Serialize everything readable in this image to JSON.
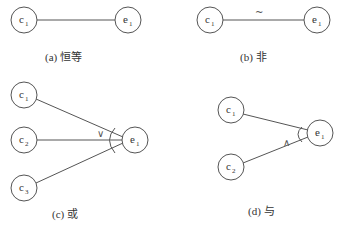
{
  "panels": [
    {
      "id": "a",
      "caption": "(a) 恒等",
      "relation": "identity",
      "symbol": "",
      "causes": [
        {
          "base": "c",
          "sub": "1"
        }
      ],
      "effect": {
        "base": "e",
        "sub": "1"
      }
    },
    {
      "id": "b",
      "caption": "(b) 非",
      "relation": "not",
      "symbol": "~",
      "causes": [
        {
          "base": "c",
          "sub": "1"
        }
      ],
      "effect": {
        "base": "e",
        "sub": "1"
      }
    },
    {
      "id": "c",
      "caption": "(c) 或",
      "relation": "or",
      "symbol": "∨",
      "causes": [
        {
          "base": "c",
          "sub": "1"
        },
        {
          "base": "c",
          "sub": "2"
        },
        {
          "base": "c",
          "sub": "3"
        }
      ],
      "effect": {
        "base": "e",
        "sub": "1"
      }
    },
    {
      "id": "d",
      "caption": "(d) 与",
      "relation": "and",
      "symbol": "∧",
      "causes": [
        {
          "base": "c",
          "sub": "1"
        },
        {
          "base": "c",
          "sub": "2"
        }
      ],
      "effect": {
        "base": "e",
        "sub": "1"
      }
    }
  ],
  "colors": {
    "stroke": "#555555",
    "text": "#333333",
    "background": "#ffffff"
  }
}
